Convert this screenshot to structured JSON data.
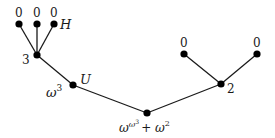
{
  "diagram": {
    "type": "tree",
    "line_color": "#1a1a1a",
    "node_color": "#000000",
    "nodes": [
      {
        "id": "leaf1",
        "x": 19,
        "y": 24,
        "label": "0",
        "lx": 15,
        "ly": 17
      },
      {
        "id": "leaf2",
        "x": 37,
        "y": 24,
        "label": "0",
        "lx": 33,
        "ly": 17
      },
      {
        "id": "leaf3",
        "x": 54,
        "y": 24,
        "label": "0",
        "lx": 50,
        "ly": 17
      },
      {
        "id": "node3",
        "x": 37,
        "y": 55,
        "label": "3",
        "lx": 22,
        "ly": 63
      },
      {
        "id": "omega3",
        "x": 73,
        "y": 85,
        "label": "ω³",
        "lx": 47,
        "ly": 96
      },
      {
        "id": "root",
        "x": 147,
        "y": 113,
        "label": "ω^(ω³) + ω²",
        "lx": 120,
        "ly": 132
      },
      {
        "id": "node2",
        "x": 221,
        "y": 84,
        "label": "2",
        "lx": 227,
        "ly": 93
      },
      {
        "id": "leaf4",
        "x": 184,
        "y": 54,
        "label": "0",
        "lx": 180,
        "ly": 47
      },
      {
        "id": "leaf5",
        "x": 257,
        "y": 54,
        "label": "0",
        "lx": 253,
        "ly": 47
      }
    ],
    "edges": [
      [
        "leaf1",
        "node3"
      ],
      [
        "leaf2",
        "node3"
      ],
      [
        "leaf3",
        "node3"
      ],
      [
        "node3",
        "omega3"
      ],
      [
        "omega3",
        "root"
      ],
      [
        "root",
        "node2"
      ],
      [
        "node2",
        "leaf4"
      ],
      [
        "node2",
        "leaf5"
      ]
    ],
    "annotations": {
      "H": {
        "text": "H",
        "x": 60,
        "y": 29
      },
      "U": {
        "text": "U",
        "x": 80,
        "y": 84
      }
    },
    "root_label": {
      "base": "ω",
      "sup1": "ω",
      "sup2": "3",
      "plus": "+ ω",
      "plus_sup": "2"
    },
    "omega3_label": {
      "base": "ω",
      "sup": "3"
    }
  }
}
